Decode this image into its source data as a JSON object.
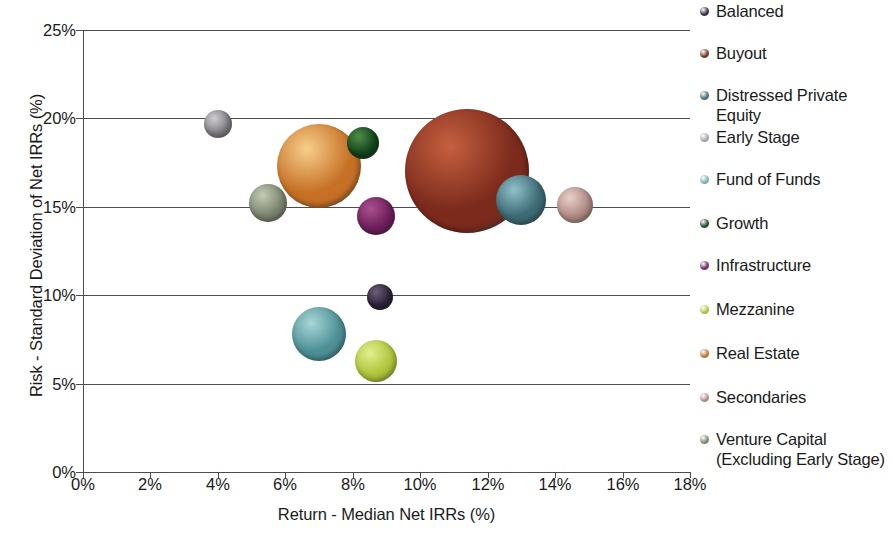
{
  "chart_data": {
    "type": "scatter",
    "subtype": "bubble",
    "title": "",
    "xlabel": "Return - Median Net IRRs (%)",
    "ylabel": "Risk - Standard Deviation of Net IRRs (%)",
    "xlim": [
      0,
      18
    ],
    "ylim": [
      0,
      25
    ],
    "xticks": [
      "0%",
      "2%",
      "4%",
      "6%",
      "8%",
      "10%",
      "12%",
      "14%",
      "16%",
      "18%"
    ],
    "xtick_values": [
      0,
      2,
      4,
      6,
      8,
      10,
      12,
      14,
      16,
      18
    ],
    "yticks": [
      "0%",
      "5%",
      "10%",
      "15%",
      "20%",
      "25%"
    ],
    "ytick_values": [
      0,
      5,
      10,
      15,
      20,
      25
    ],
    "grid": "horizontal",
    "legend_position": "right",
    "points": [
      {
        "name": "Balanced",
        "x": 8.8,
        "y": 9.9,
        "size": 13,
        "color": "#2e2338",
        "highlight": "#6b5f7a"
      },
      {
        "name": "Buyout",
        "x": 11.4,
        "y": 17.0,
        "size": 62,
        "color": "#7b2a1c",
        "highlight": "#c5603f"
      },
      {
        "name": "Distressed Private Equity",
        "x": 13.0,
        "y": 15.4,
        "size": 25,
        "color": "#3d6a74",
        "highlight": "#8fc0c9"
      },
      {
        "name": "Early Stage",
        "x": 4.0,
        "y": 19.7,
        "size": 14,
        "color": "#827f86",
        "highlight": "#cfcdd2"
      },
      {
        "name": "Fund of Funds",
        "x": 7.0,
        "y": 7.8,
        "size": 27,
        "color": "#4d9096",
        "highlight": "#a8d6d6"
      },
      {
        "name": "Growth",
        "x": 8.3,
        "y": 18.6,
        "size": 16,
        "color": "#14441c",
        "highlight": "#4f8d49"
      },
      {
        "name": "Infrastructure",
        "x": 8.7,
        "y": 14.5,
        "size": 19,
        "color": "#6e1f5c",
        "highlight": "#a8528e"
      },
      {
        "name": "Mezzanine",
        "x": 8.7,
        "y": 6.3,
        "size": 21,
        "color": "#b0c43a",
        "highlight": "#e2ef90"
      },
      {
        "name": "Real Estate",
        "x": 7.0,
        "y": 17.3,
        "size": 42,
        "color": "#c67026",
        "highlight": "#f7cf8a"
      },
      {
        "name": "Secondaries",
        "x": 14.6,
        "y": 15.1,
        "size": 18,
        "color": "#b08b85",
        "highlight": "#e8cfc8"
      },
      {
        "name": "Venture Capital (Excluding Early Stage)",
        "x": 5.5,
        "y": 15.2,
        "size": 19,
        "color": "#7c8570",
        "highlight": "#c3cbb4"
      }
    ],
    "legend": [
      {
        "label": "Balanced",
        "color": "#2e2338"
      },
      {
        "label": "Buyout",
        "color": "#7b2a1c"
      },
      {
        "label": "Distressed Private Equity",
        "color": "#3d6a74"
      },
      {
        "label": "Early Stage",
        "color": "#a7a4ab"
      },
      {
        "label": "Fund of Funds",
        "color": "#7ab3b4"
      },
      {
        "label": "Growth",
        "color": "#14441c"
      },
      {
        "label": "Infrastructure",
        "color": "#6e1f5c"
      },
      {
        "label": "Mezzanine",
        "color": "#b0c43a"
      },
      {
        "label": "Real Estate",
        "color": "#c67026"
      },
      {
        "label": "Secondaries",
        "color": "#b08b85"
      },
      {
        "label": "Venture Capital (Excluding Early Stage)",
        "color": "#7c8570"
      }
    ]
  },
  "axis": {
    "x_title": "Return - Median Net IRRs (%)",
    "y_title": "Risk - Standard Deviation of Net IRRs (%)"
  },
  "colors": {
    "axis_line": "#4c4c4c",
    "gridline": "#4c4c4c",
    "text": "#1a1a1a",
    "background": "#ffffff"
  }
}
